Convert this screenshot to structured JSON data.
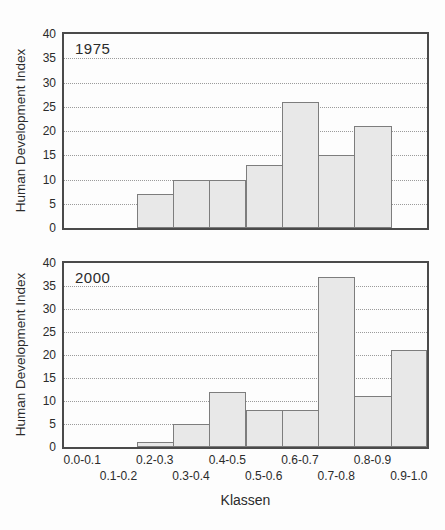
{
  "figure": {
    "shared_xlabel": "Klassen"
  },
  "colors": {
    "background": "#fdfdfd",
    "bar_fill": "#e8e8e8",
    "bar_border": "#7d7d7d",
    "frame": "#4a4a4a",
    "gridline": "#9b9b9b",
    "text": "#2b2b2b"
  },
  "chart_data": [
    {
      "type": "bar",
      "title": "1975",
      "ylabel": "Human Development Index",
      "xlabel": "",
      "categories": [
        "0.0-0.1",
        "0.1-0.2",
        "0.2-0.3",
        "0.3-0.4",
        "0.4-0.5",
        "0.5-0.6",
        "0.6-0.7",
        "0.7-0.8",
        "0.8-0.9",
        "0.9-1.0"
      ],
      "values": [
        0,
        0,
        7,
        10,
        10,
        13,
        26,
        15,
        21,
        0
      ],
      "ylim": [
        0,
        40
      ],
      "yticks": [
        0,
        5,
        10,
        15,
        20,
        25,
        30,
        35,
        40
      ],
      "grid": "horizontal-dotted",
      "x_tick_labels_visible": false,
      "legend": "none"
    },
    {
      "type": "bar",
      "title": "2000",
      "ylabel": "Human Development Index",
      "xlabel": "Klassen",
      "categories": [
        "0.0-0.1",
        "0.1-0.2",
        "0.2-0.3",
        "0.3-0.4",
        "0.4-0.5",
        "0.5-0.6",
        "0.6-0.7",
        "0.7-0.8",
        "0.8-0.9",
        "0.9-1.0"
      ],
      "values": [
        0,
        0,
        1,
        5,
        12,
        8,
        8,
        37,
        11,
        21
      ],
      "ylim": [
        0,
        40
      ],
      "yticks": [
        0,
        5,
        10,
        15,
        20,
        25,
        30,
        35,
        40
      ],
      "grid": "horizontal-dotted",
      "x_tick_labels_visible": true,
      "legend": "none"
    }
  ]
}
